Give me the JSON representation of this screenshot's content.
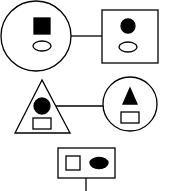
{
  "diagram": {
    "colors": {
      "stroke": "#000000",
      "fill": "#000000",
      "background": "#ffffff"
    },
    "rows": [
      {
        "left": {
          "outer": "circle",
          "top": "filled-square",
          "bottom": "hollow-ellipse"
        },
        "right": {
          "outer": "square",
          "top": "filled-circle",
          "bottom": "hollow-ellipse"
        }
      },
      {
        "left": {
          "outer": "triangle",
          "top": "filled-circle",
          "bottom": "hollow-rectangle"
        },
        "right": {
          "outer": "circle",
          "top": "filled-triangle",
          "bottom": "hollow-rectangle"
        }
      },
      {
        "center": {
          "outer": "rectangle",
          "left": "hollow-square",
          "right": "filled-ellipse"
        }
      }
    ]
  }
}
